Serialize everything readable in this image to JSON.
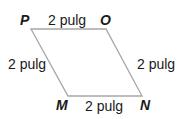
{
  "diagram": {
    "type": "rhombus",
    "stroke_color": "#a6a6a6",
    "vertices": [
      {
        "name": "P",
        "x": 31,
        "y": 29
      },
      {
        "name": "O",
        "x": 106,
        "y": 29
      },
      {
        "name": "N",
        "x": 142,
        "y": 96
      },
      {
        "name": "M",
        "x": 68,
        "y": 96
      }
    ],
    "side_labels": {
      "top": "2 pulg",
      "left": "2 pulg",
      "right": "2 pulg",
      "bottom": "2 pulg"
    }
  }
}
